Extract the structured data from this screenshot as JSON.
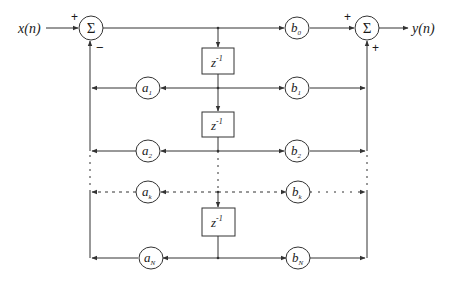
{
  "diagram": {
    "type": "direct-form-II IIR filter block diagram",
    "input_label": "x(n)",
    "output_label": "y(n)",
    "summer_symbol": "Σ",
    "input_summer": {
      "plus_sign": "+",
      "minus_sign": "−"
    },
    "output_summer": {
      "plus_top": "+",
      "plus_bottom": "+"
    },
    "delay_label": {
      "base": "z",
      "exp": "-1"
    },
    "feedback_coeffs": [
      {
        "base": "a",
        "sub": "1"
      },
      {
        "base": "a",
        "sub": "2"
      },
      {
        "base": "a",
        "sub": "k"
      },
      {
        "base": "a",
        "sub": "N"
      }
    ],
    "feedforward_coeffs": [
      {
        "base": "b",
        "sub": "0"
      },
      {
        "base": "b",
        "sub": "1"
      },
      {
        "base": "b",
        "sub": "2"
      },
      {
        "base": "b",
        "sub": "k"
      },
      {
        "base": "b",
        "sub": "N"
      }
    ],
    "line_color": "#333333"
  }
}
